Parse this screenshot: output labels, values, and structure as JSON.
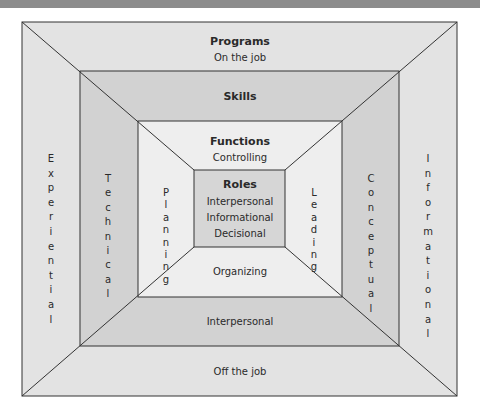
{
  "diagram": {
    "colors": {
      "header_bar": "#8c8c8c",
      "programs_layer": "#e3e3e3",
      "skills_layer": "#d2d2d2",
      "functions_layer": "#eeeeee",
      "roles_layer": "#d6d6d6",
      "line": "#333333"
    },
    "programs": {
      "title": "Programs",
      "top": "On the job",
      "bottom": "Off the job",
      "left": "Experiential",
      "right": "Informational"
    },
    "skills": {
      "title": "Skills",
      "bottom": "Interpersonal",
      "left": "Technical",
      "right": "Conceptual"
    },
    "functions": {
      "title": "Functions",
      "top": "Controlling",
      "bottom": "Organizing",
      "left": "Planning",
      "right": "Leading"
    },
    "roles": {
      "title": "Roles",
      "items": [
        "Interpersonal",
        "Informational",
        "Decisional"
      ]
    }
  }
}
